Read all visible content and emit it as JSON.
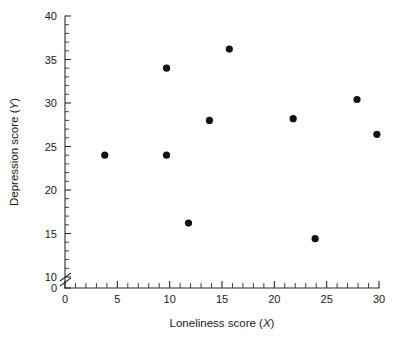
{
  "chart_data": {
    "type": "scatter",
    "title": "",
    "xlabel": "Loneliness score (X)",
    "ylabel": "Depression score (Y)",
    "xlim": [
      0,
      30
    ],
    "ylim": [
      0,
      40
    ],
    "y_axis_break": true,
    "y_break_between": [
      0,
      10
    ],
    "grid": false,
    "legend": "none",
    "x_major_ticks": [
      0,
      5,
      10,
      15,
      20,
      25,
      30
    ],
    "x_minor_tick_step": 1,
    "y_major_ticks": [
      0,
      10,
      15,
      20,
      25,
      30,
      35,
      40
    ],
    "y_minor_tick_step": 1,
    "x_tick_labels": [
      "0",
      "5",
      "10",
      "15",
      "20",
      "25",
      "30"
    ],
    "y_tick_labels": [
      "0",
      "10",
      "15",
      "20",
      "25",
      "30",
      "35",
      "40"
    ],
    "marker": "filled-circle",
    "marker_color": "#111111",
    "points": [
      {
        "x": 3.8,
        "y": 24.0
      },
      {
        "x": 9.7,
        "y": 34.0
      },
      {
        "x": 9.7,
        "y": 24.0
      },
      {
        "x": 11.8,
        "y": 16.2
      },
      {
        "x": 13.8,
        "y": 28.0
      },
      {
        "x": 15.7,
        "y": 36.2
      },
      {
        "x": 21.8,
        "y": 28.2
      },
      {
        "x": 23.9,
        "y": 14.4
      },
      {
        "x": 27.9,
        "y": 30.4
      },
      {
        "x": 29.8,
        "y": 26.4
      }
    ],
    "x_values": [
      3.8,
      9.7,
      9.7,
      11.8,
      13.8,
      15.7,
      21.8,
      23.9,
      27.9,
      29.8
    ],
    "y_values": [
      24.0,
      34.0,
      24.0,
      16.2,
      28.0,
      36.2,
      28.2,
      14.4,
      30.4,
      26.4
    ]
  },
  "axis": {
    "x_label_prefix": "Loneliness score (",
    "x_label_var": "X",
    "x_label_suffix": ")",
    "y_label_prefix": "Depression score (",
    "y_label_var": "Y",
    "y_label_suffix": ")"
  },
  "colors": {
    "marker": "#111111",
    "axis": "#2b2b2b",
    "text": "#1a1a1a",
    "background": "#ffffff"
  }
}
